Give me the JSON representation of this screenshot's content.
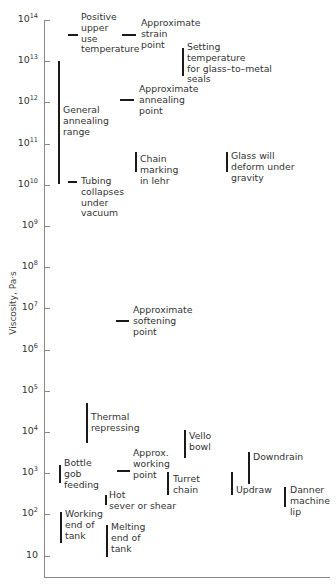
{
  "chart_data": {
    "type": "annotated-range",
    "title": "",
    "ylabel": "Viscosity, Pa·s",
    "xlabel": "",
    "yscale": "log",
    "ylim": [
      1,
      100000000000000
    ],
    "grid": false,
    "y_ticks": [
      {
        "label_base": "10",
        "label_exp": "14",
        "value": 100000000000000.0
      },
      {
        "label_base": "10",
        "label_exp": "13",
        "value": 10000000000000.0
      },
      {
        "label_base": "10",
        "label_exp": "12",
        "value": 1000000000000.0
      },
      {
        "label_base": "10",
        "label_exp": "11",
        "value": 100000000000.0
      },
      {
        "label_base": "10",
        "label_exp": "10",
        "value": 10000000000.0
      },
      {
        "label_base": "10",
        "label_exp": "9",
        "value": 1000000000.0
      },
      {
        "label_base": "10",
        "label_exp": "8",
        "value": 100000000.0
      },
      {
        "label_base": "10",
        "label_exp": "7",
        "value": 10000000.0
      },
      {
        "label_base": "10",
        "label_exp": "6",
        "value": 1000000.0
      },
      {
        "label_base": "10",
        "label_exp": "5",
        "value": 100000.0
      },
      {
        "label_base": "10",
        "label_exp": "4",
        "value": 10000.0
      },
      {
        "label_base": "10",
        "label_exp": "3",
        "value": 1000.0
      },
      {
        "label_base": "10",
        "label_exp": "2",
        "value": 100.0
      },
      {
        "label_base": "10",
        "label_exp": "",
        "value": 10
      }
    ],
    "points": [
      {
        "label": "Positive upper use temperature",
        "log_viscosity": 13.6
      },
      {
        "label": "Approximate strain point",
        "log_viscosity": 13.6
      },
      {
        "label": "Approximate annealing point",
        "log_viscosity": 12.0
      },
      {
        "label": "Tubing collapses under vacuum",
        "log_viscosity": 10.0
      },
      {
        "label": "Approximate softening point",
        "log_viscosity": 6.65
      },
      {
        "label": "Approx. working point",
        "log_viscosity": 3.0
      }
    ],
    "ranges": [
      {
        "label": "Setting temperature for glass-to-metal seals",
        "log_min": 12.6,
        "log_max": 13.3
      },
      {
        "label": "General annealing range",
        "log_min": 10.0,
        "log_max": 13.0
      },
      {
        "label": "Chain marking in lehr",
        "log_min": 10.3,
        "log_max": 10.8
      },
      {
        "label": "Glass will deform under gravity",
        "log_min": 10.3,
        "log_max": 10.8
      },
      {
        "label": "Thermal repressing",
        "log_min": 3.7,
        "log_max": 4.7
      },
      {
        "label": "Vello bowl",
        "log_min": 3.3,
        "log_max": 4.0
      },
      {
        "label": "Bottle gob feeding",
        "log_min": 2.75,
        "log_max": 3.2
      },
      {
        "label": "Turret chain",
        "log_min": 2.45,
        "log_max": 3.0
      },
      {
        "label": "Downdrain",
        "log_min": 2.7,
        "log_max": 3.5
      },
      {
        "label": "Updraw",
        "log_min": 2.45,
        "log_max": 3.0
      },
      {
        "label": "Danner machine lip",
        "log_min": 2.2,
        "log_max": 2.7
      },
      {
        "label": "Hot sever or shear",
        "log_min": 2.2,
        "log_max": 2.45
      },
      {
        "label": "Working end of tank",
        "log_min": 1.25,
        "log_max": 2.0
      },
      {
        "label": "Melting end of tank",
        "log_min": 0.9,
        "log_max": 1.7
      }
    ]
  },
  "annotations": {
    "positive_upper": [
      "Positive",
      "upper",
      "use",
      "temperature"
    ],
    "strain": [
      "Approximate",
      "strain",
      "point"
    ],
    "setting": [
      "Setting",
      "temperature",
      "for glass–to–metal",
      "seals"
    ],
    "annealing_point": [
      "Approximate",
      "annealing",
      "point"
    ],
    "annealing_range": [
      "General",
      "annealing",
      "range"
    ],
    "chain_marking": [
      "Chain",
      "marking",
      "in lehr"
    ],
    "glass_deform": [
      "Glass will",
      "deform under",
      "gravity"
    ],
    "tubing": [
      "Tubing",
      "collapses",
      "under",
      "vacuum"
    ],
    "softening": [
      "Approximate",
      "softening",
      "point"
    ],
    "thermal": [
      "Thermal",
      "repressing"
    ],
    "vello": [
      "Vello",
      "bowl"
    ],
    "bottle": [
      "Bottle",
      "gob",
      "feeding"
    ],
    "working_point": [
      "Approx.",
      "working",
      "point"
    ],
    "turret": [
      "Turret",
      "chain"
    ],
    "downdrain": [
      "Downdrain"
    ],
    "updraw": [
      "Updraw"
    ],
    "danner": [
      "Danner",
      "machine",
      "lip"
    ],
    "hot_sever": [
      "Hot",
      "sever or shear"
    ],
    "working_end": [
      "Working",
      "end of",
      "tank"
    ],
    "melting_end": [
      "Melting",
      "end of",
      "tank"
    ]
  }
}
